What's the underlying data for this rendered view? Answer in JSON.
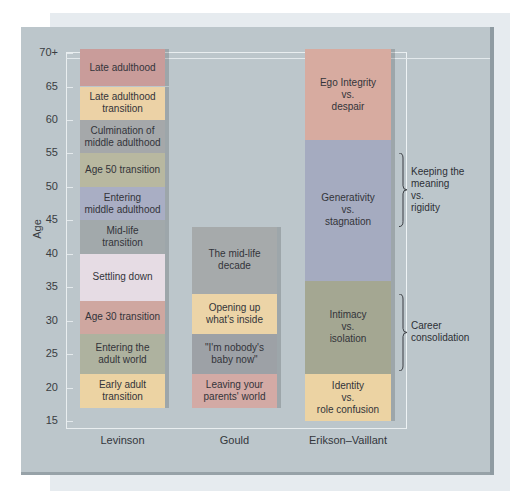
{
  "chart_data": {
    "type": "table",
    "title": "",
    "xlabel": "",
    "ylabel": "Age",
    "ylim": [
      15,
      70
    ],
    "yticks": [
      "15",
      "20",
      "25",
      "30",
      "35",
      "40",
      "45",
      "50",
      "55",
      "60",
      "65",
      "70+"
    ],
    "grid": false,
    "categories": [
      "Levinson",
      "Gould",
      "Erikson–Vaillant"
    ],
    "series": [
      {
        "name": "Levinson",
        "stages": [
          {
            "label": "Early adult\ntransition",
            "from": 17,
            "to": 22,
            "color": "#ecd3a3"
          },
          {
            "label": "Entering the\nadult world",
            "from": 22,
            "to": 28,
            "color": "#aeb29f"
          },
          {
            "label": "Age 30 transition",
            "from": 28,
            "to": 33,
            "color": "#cfa7a0"
          },
          {
            "label": "Settling down",
            "from": 33,
            "to": 40,
            "color": "#e6dce4"
          },
          {
            "label": "Mid-life\ntransition",
            "from": 40,
            "to": 45,
            "color": "#a2a9ab"
          },
          {
            "label": "Entering\nmiddle adulthood",
            "from": 45,
            "to": 50,
            "color": "#a9aec4"
          },
          {
            "label": "Age 50 transition",
            "from": 50,
            "to": 55,
            "color": "#b8b8a0"
          },
          {
            "label": "Culmination of\nmiddle adulthood",
            "from": 55,
            "to": 60,
            "color": "#a5a8aa"
          },
          {
            "label": "Late adulthood\ntransition",
            "from": 60,
            "to": 65,
            "color": "#ecd2a6"
          },
          {
            "label": "Late adulthood",
            "from": 65,
            "to": 70,
            "color": "#c99c9a"
          }
        ]
      },
      {
        "name": "Gould",
        "stages": [
          {
            "label": "Leaving your\nparents' world",
            "from": 17,
            "to": 22,
            "color": "#d3aaa5"
          },
          {
            "label": "\"I'm nobody's\nbaby now\"",
            "from": 22,
            "to": 28,
            "color": "#9da1a6"
          },
          {
            "label": "Opening up\nwhat's inside",
            "from": 28,
            "to": 34,
            "color": "#ecd4a7"
          },
          {
            "label": "The mid-life\ndecade",
            "from": 34,
            "to": 44,
            "color": "#a6aaab"
          }
        ]
      },
      {
        "name": "Erikson–Vaillant",
        "stages": [
          {
            "label": "Identity\nvs.\nrole confusion",
            "from": 15,
            "to": 22,
            "color": "#ecd3a3"
          },
          {
            "label": "Intimacy\nvs.\nisolation",
            "from": 22,
            "to": 36,
            "color": "#a4a792"
          },
          {
            "label": "Generativity\nvs.\nstagnation",
            "from": 36,
            "to": 57,
            "color": "#a5abc0"
          },
          {
            "label": "Ego Integrity\nvs.\ndespair",
            "from": 57,
            "to": 70,
            "color": "#d7aba0"
          }
        ]
      }
    ],
    "annotations": [
      {
        "label": "Keeping the\nmeaning\nvs.\nrigidity",
        "from": 44,
        "to": 55,
        "type": "bracket"
      },
      {
        "label": "Career\nconsolidation",
        "from": 22.5,
        "to": 34,
        "type": "bracket"
      }
    ]
  }
}
